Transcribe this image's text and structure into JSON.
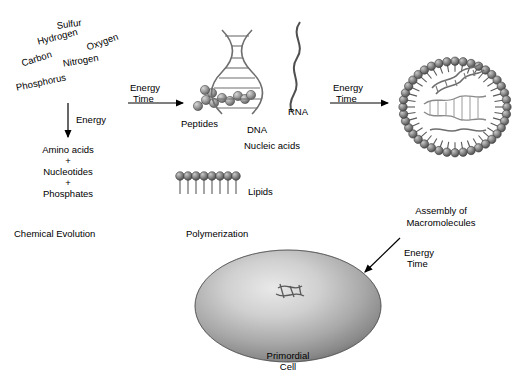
{
  "stage1": {
    "elements": [
      {
        "name": "sulfur",
        "label": "Sulfur"
      },
      {
        "name": "hydrogen",
        "label": "Hydrogen"
      },
      {
        "name": "oxygen",
        "label": "Oxygen"
      },
      {
        "name": "carbon",
        "label": "Carbon"
      },
      {
        "name": "nitrogen",
        "label": "Nitrogen"
      },
      {
        "name": "phosphorus",
        "label": "Phosphorus"
      }
    ],
    "arrow_label": "Energy",
    "products": [
      "Amino acids",
      "+",
      "Nucleotides",
      "+",
      "Phosphates"
    ],
    "caption": "Chemical Evolution"
  },
  "stage2": {
    "arrow_label_line1": "Energy",
    "arrow_label_line2": "Time",
    "peptides": "Peptides",
    "dna": "DNA",
    "rna": "RNA",
    "nucleic_acids": "Nucleic acids",
    "lipids": "Lipids",
    "caption": "Polymerization"
  },
  "stage3": {
    "arrow_label_line1": "Energy",
    "arrow_label_line2": "Time",
    "caption_line1": "Assembly of",
    "caption_line2": "Macromolecules"
  },
  "stage4": {
    "arrow_label_line1": "Energy",
    "arrow_label_line2": "Time",
    "caption_line1": "Primordial",
    "caption_line2": "Cell"
  }
}
